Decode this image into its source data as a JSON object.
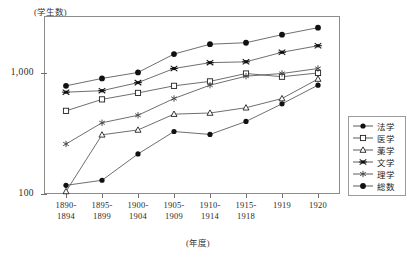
{
  "chart_data": {
    "type": "line",
    "title": "",
    "subtitle": "",
    "xlabel": "(年度)",
    "ylabel": "(学生数)",
    "yscale": "log",
    "ylim": [
      100,
      3000
    ],
    "y_ticks": [
      {
        "value": 1000,
        "label": "1,000"
      },
      {
        "value": 100,
        "label": "100"
      }
    ],
    "grid": false,
    "legend_position": "right",
    "categories": [
      "1890-\n1894",
      "1895-\n1899",
      "1900-\n1904",
      "1905-\n1909",
      "1910-\n1914",
      "1915-\n1918",
      "1919",
      "1920"
    ],
    "x_tick_labels": [
      {
        "line1": "1890-",
        "line2": "1894"
      },
      {
        "line1": "1895-",
        "line2": "1899"
      },
      {
        "line1": "1900-",
        "line2": "1904"
      },
      {
        "line1": "1905-",
        "line2": "1909"
      },
      {
        "line1": "1910-",
        "line2": "1914"
      },
      {
        "line1": "1915-",
        "line2": "1918"
      },
      {
        "line1": "1919",
        "line2": ""
      },
      {
        "line1": "1920",
        "line2": ""
      }
    ],
    "series": [
      {
        "name": "法学",
        "marker": "filled-circle",
        "values": [
          118,
          130,
          215,
          330,
          312,
          400,
          560,
          800
        ]
      },
      {
        "name": "医学",
        "marker": "open-square",
        "values": [
          490,
          610,
          690,
          790,
          860,
          1000,
          940,
          1010
        ]
      },
      {
        "name": "薬学",
        "marker": "open-triangle",
        "values": [
          105,
          310,
          340,
          460,
          470,
          520,
          620,
          900
        ]
      },
      {
        "name": "文学",
        "marker": "star-x",
        "values": [
          700,
          720,
          840,
          1100,
          1230,
          1250,
          1500,
          1700
        ]
      },
      {
        "name": "理学",
        "marker": "asterisk",
        "values": [
          260,
          390,
          450,
          620,
          800,
          950,
          1000,
          1100
        ]
      },
      {
        "name": "総数",
        "marker": "filled-circle-large",
        "values": [
          790,
          910,
          1020,
          1450,
          1750,
          1800,
          2100,
          2400
        ]
      }
    ]
  },
  "legend": {
    "items": [
      {
        "label": "法学",
        "marker": "filled-circle"
      },
      {
        "label": "医学",
        "marker": "open-square"
      },
      {
        "label": "薬学",
        "marker": "open-triangle"
      },
      {
        "label": "文学",
        "marker": "star-x"
      },
      {
        "label": "理学",
        "marker": "asterisk"
      },
      {
        "label": "総数",
        "marker": "filled-circle-large"
      }
    ]
  },
  "axis_captions": {
    "y_unit": "(学生数)",
    "x_unit": "(年度)"
  },
  "colors": {
    "line": "#4a4a4a",
    "frame": "#8c8c8c",
    "text": "#2a2a2a"
  }
}
